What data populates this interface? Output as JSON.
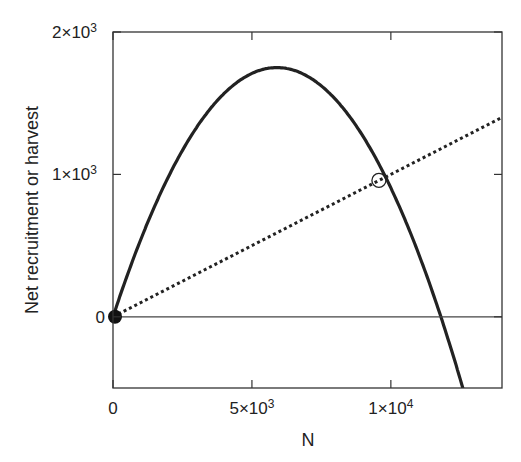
{
  "chart_data": {
    "type": "line",
    "title": "",
    "xlabel": "N",
    "ylabel": "Net recruitment or harvest",
    "xlim": [
      0,
      14000
    ],
    "ylim": [
      -500,
      2000
    ],
    "grid": false,
    "legend": null,
    "x_ticks": [
      {
        "value": 0,
        "label": "0"
      },
      {
        "value": 5000,
        "label": "5×10",
        "exp": "3"
      },
      {
        "value": 10000,
        "label": "1×10",
        "exp": "4"
      }
    ],
    "y_ticks": [
      {
        "value": 0,
        "label": "0"
      },
      {
        "value": 1000,
        "label": "1×10",
        "exp": "3"
      },
      {
        "value": 2000,
        "label": "2×10",
        "exp": "3"
      }
    ],
    "series": [
      {
        "name": "Net recruitment",
        "style": "solid-thick",
        "color": "#222222",
        "x": [
          0,
          1000,
          2000,
          3000,
          4000,
          5000,
          5900,
          7000,
          8000,
          9000,
          10000,
          11000,
          11800,
          12600
        ],
        "values": [
          0,
          543,
          986,
          1329,
          1570,
          1711,
          1750,
          1657,
          1529,
          1273,
          910,
          438,
          0,
          -508
        ]
      },
      {
        "name": "Harvest",
        "style": "dotted",
        "color": "#222222",
        "x": [
          0,
          14000
        ],
        "values": [
          0,
          1400
        ]
      },
      {
        "name": "Zero line",
        "style": "solid-thin",
        "color": "#444444",
        "x": [
          0,
          14000
        ],
        "values": [
          0,
          0
        ]
      }
    ],
    "annotations": [
      {
        "type": "filled-circle",
        "x": 0,
        "y": 0,
        "meaning": "unstable equilibrium"
      },
      {
        "type": "open-circle",
        "x": 9570,
        "y": 958,
        "meaning": "stable equilibrium"
      }
    ]
  }
}
